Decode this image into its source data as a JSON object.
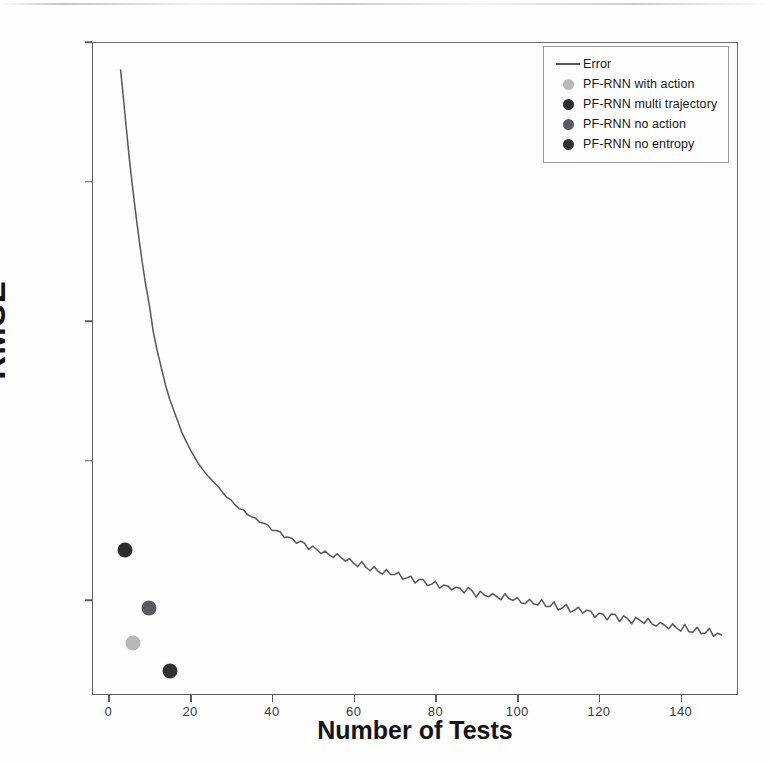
{
  "chart_data": {
    "type": "line",
    "title": "",
    "xlabel": "Number of Tests",
    "ylabel": "RMSE",
    "xlim": [
      -4,
      154
    ],
    "ylim": [
      0.16,
      2.5
    ],
    "grid": false,
    "legend_position": "upper right",
    "xticks": [
      0,
      20,
      40,
      60,
      80,
      100,
      120,
      140
    ],
    "xtick_labels": [
      "0",
      "20",
      "40",
      "60",
      "80",
      "100",
      "120",
      "140"
    ],
    "yticks": [
      2.5,
      2.0,
      1.5,
      1.0,
      0.5
    ],
    "ytick_labels": [
      "2.5",
      "2.0",
      "5",
      "1.0",
      "0.5"
    ],
    "series": [
      {
        "name": "Error",
        "type": "line",
        "color": "#57575c",
        "x": [
          3,
          4,
          5,
          6,
          7,
          8,
          9,
          10,
          11,
          12,
          13,
          14,
          15,
          16,
          17,
          18,
          19,
          20,
          22,
          24,
          26,
          28,
          30,
          32,
          34,
          36,
          38,
          40,
          44,
          48,
          52,
          56,
          60,
          64,
          68,
          72,
          76,
          80,
          84,
          88,
          92,
          96,
          100,
          104,
          108,
          112,
          116,
          120,
          124,
          128,
          132,
          136,
          140,
          144,
          148,
          150
        ],
        "y": [
          2.4,
          2.25,
          2.1,
          1.97,
          1.85,
          1.74,
          1.64,
          1.56,
          1.46,
          1.39,
          1.33,
          1.27,
          1.22,
          1.18,
          1.14,
          1.1,
          1.07,
          1.04,
          0.99,
          0.95,
          0.92,
          0.885,
          0.855,
          0.83,
          0.81,
          0.79,
          0.775,
          0.755,
          0.725,
          0.7,
          0.675,
          0.655,
          0.635,
          0.615,
          0.6,
          0.585,
          0.57,
          0.555,
          0.545,
          0.535,
          0.52,
          0.51,
          0.5,
          0.49,
          0.48,
          0.47,
          0.46,
          0.45,
          0.44,
          0.43,
          0.42,
          0.41,
          0.4,
          0.39,
          0.38,
          0.375
        ]
      },
      {
        "name": "PF-RNN with action",
        "type": "scatter",
        "color": "#b9b9bb",
        "points": [
          {
            "x": 6,
            "y": 0.345
          }
        ]
      },
      {
        "name": "PF-RNN multi trajectory",
        "type": "scatter",
        "color": "#2b2b30",
        "points": [
          {
            "x": 4,
            "y": 0.68
          }
        ]
      },
      {
        "name": "PF-RNN no action",
        "type": "scatter",
        "color": "#5a5a60",
        "points": [
          {
            "x": 10,
            "y": 0.47
          }
        ]
      },
      {
        "name": "PF-RNN no entropy",
        "type": "scatter",
        "color": "#303035",
        "points": [
          {
            "x": 15,
            "y": 0.245
          }
        ]
      }
    ]
  },
  "legend": {
    "entries": [
      {
        "label": "Error",
        "marker": "line",
        "color": "#57575c"
      },
      {
        "label": "PF-RNN with action",
        "marker": "dot",
        "color": "#b9b9bb"
      },
      {
        "label": "PF-RNN multi trajectory",
        "marker": "dot",
        "color": "#2b2b30"
      },
      {
        "label": "PF-RNN no action",
        "marker": "dot",
        "color": "#5a5a60"
      },
      {
        "label": "PF-RNN no entropy",
        "marker": "dot",
        "color": "#303035"
      }
    ]
  },
  "axes": {
    "y_title": "RMSE",
    "x_title": "Number of Tests"
  }
}
